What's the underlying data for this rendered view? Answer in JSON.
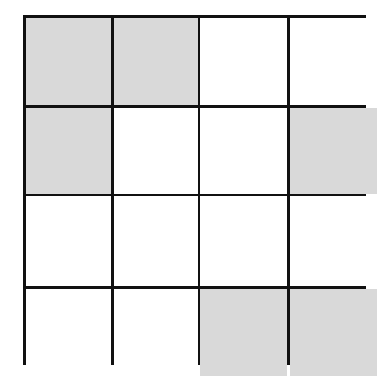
{
  "diagram": {
    "type": "grid",
    "rows": 4,
    "cols": 4,
    "colors": {
      "line": "#111111",
      "shaded": "#d9d9d9",
      "empty": "#ffffff"
    },
    "cells": [
      [
        1,
        1,
        0,
        0
      ],
      [
        1,
        0,
        0,
        1
      ],
      [
        0,
        0,
        0,
        0
      ],
      [
        0,
        0,
        1,
        1
      ]
    ],
    "shaded_count": 6
  }
}
